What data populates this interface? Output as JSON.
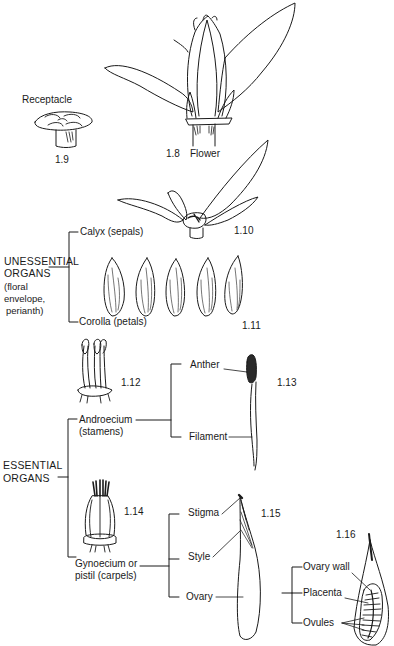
{
  "figure": {
    "figures": [
      {
        "id": "1.8",
        "number": "1.8",
        "caption": "Flower"
      },
      {
        "id": "1.9",
        "number": "1.9",
        "caption": "Receptacle"
      },
      {
        "id": "1.10",
        "number": "1.10",
        "caption": ""
      },
      {
        "id": "1.11",
        "number": "1.11",
        "caption": ""
      },
      {
        "id": "1.12",
        "number": "1.12",
        "caption": ""
      },
      {
        "id": "1.13",
        "number": "1.13",
        "caption": ""
      },
      {
        "id": "1.14",
        "number": "1.14",
        "caption": ""
      },
      {
        "id": "1.15",
        "number": "1.15",
        "caption": ""
      },
      {
        "id": "1.16",
        "number": "1.16",
        "caption": ""
      }
    ],
    "groups": {
      "unessential": {
        "title_line1": "UNESSENTIAL",
        "title_line2": "ORGANS",
        "note_line1": "(floral",
        "note_line2": "envelope,",
        "note_line3": "perianth)",
        "members": [
          "Calyx (sepals)",
          "Corolla (petals)"
        ]
      },
      "essential": {
        "title_line1": "ESSENTIAL",
        "title_line2": "ORGANS",
        "members": {
          "androecium_line1": "Androecium",
          "androecium_line2": "(stamens)",
          "gynoecium_line1": "Gynoecium or",
          "gynoecium_line2": "pistil (carpels)"
        }
      }
    },
    "stamen_parts": [
      "Anther",
      "Filament"
    ],
    "pistil_parts": [
      "Stigma",
      "Style",
      "Ovary"
    ],
    "ovary_parts": [
      "Ovary wall",
      "Placenta",
      "Ovules"
    ],
    "colors": {
      "ink": "#1a1a1a",
      "background": "#ffffff"
    }
  }
}
